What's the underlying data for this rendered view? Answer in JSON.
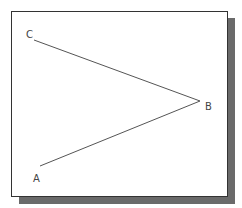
{
  "diagram": {
    "points": [
      {
        "label": "C",
        "x": 34,
        "y": 40,
        "label_x": 26,
        "label_y": 38
      },
      {
        "label": "B",
        "x": 200,
        "y": 101,
        "label_x": 205,
        "label_y": 110
      },
      {
        "label": "A",
        "x": 40,
        "y": 166,
        "label_x": 33,
        "label_y": 182
      }
    ],
    "segments": [
      {
        "from": "C",
        "to": "B"
      },
      {
        "from": "B",
        "to": "A"
      }
    ],
    "colors": {
      "line": "#555555",
      "frame": "#333333",
      "shadow": "#6a6a6a"
    }
  }
}
